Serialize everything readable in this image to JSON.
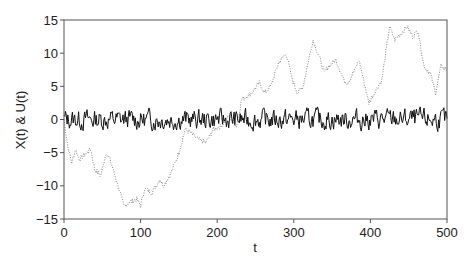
{
  "chart_data": {
    "type": "line",
    "title": "",
    "xlabel": "t",
    "ylabel": "X(t) & U(t)",
    "xlim": [
      0,
      500
    ],
    "ylim": [
      -15,
      15
    ],
    "xticks": [
      0,
      100,
      200,
      300,
      400,
      500
    ],
    "yticks": [
      15,
      10,
      5,
      0,
      -5,
      -10,
      -15
    ],
    "xtick_labels": [
      "0",
      "100",
      "200",
      "300",
      "400",
      "500"
    ],
    "ytick_labels": [
      "15",
      "10",
      "5",
      "0",
      "−5",
      "−10",
      "−15"
    ],
    "grid": false,
    "legend": null,
    "series": [
      {
        "name": "X(t)",
        "style": "dotted",
        "color": "#888888",
        "x": [
          0,
          5,
          10,
          15,
          20,
          30,
          35,
          40,
          48,
          55,
          60,
          68,
          78,
          85,
          95,
          100,
          105,
          115,
          125,
          130,
          140,
          150,
          158,
          165,
          175,
          185,
          195,
          205,
          215,
          225,
          232,
          245,
          255,
          262,
          270,
          280,
          290,
          298,
          305,
          312,
          325,
          333,
          340,
          345,
          355,
          365,
          370,
          380,
          385,
          390,
          398,
          405,
          415,
          425,
          432,
          440,
          448,
          455,
          462,
          470,
          478,
          485,
          492,
          500
        ],
        "values": [
          0,
          -4,
          -6.5,
          -4.5,
          -6,
          -5,
          -4.5,
          -7.5,
          -8.5,
          -5,
          -6,
          -9,
          -13,
          -12.5,
          -12,
          -13,
          -10.5,
          -11,
          -9,
          -10,
          -8,
          -5,
          -1.5,
          -2,
          -3,
          -3.5,
          -1.5,
          -1,
          0.5,
          -1,
          3,
          4,
          5.5,
          4,
          5,
          8.5,
          10,
          6,
          4,
          5,
          12,
          9.5,
          7,
          8,
          9,
          6,
          5.5,
          7.5,
          9,
          6.5,
          2.5,
          4,
          6,
          14,
          12,
          13,
          14,
          12.5,
          13.5,
          8,
          7,
          4,
          8,
          7.5
        ]
      },
      {
        "name": "U(t)",
        "style": "solid",
        "color": "#111111",
        "description": "white-noise-like series fluctuating around 0",
        "mean": 0,
        "range": [
          -2,
          2
        ],
        "n_points": 500
      }
    ]
  }
}
